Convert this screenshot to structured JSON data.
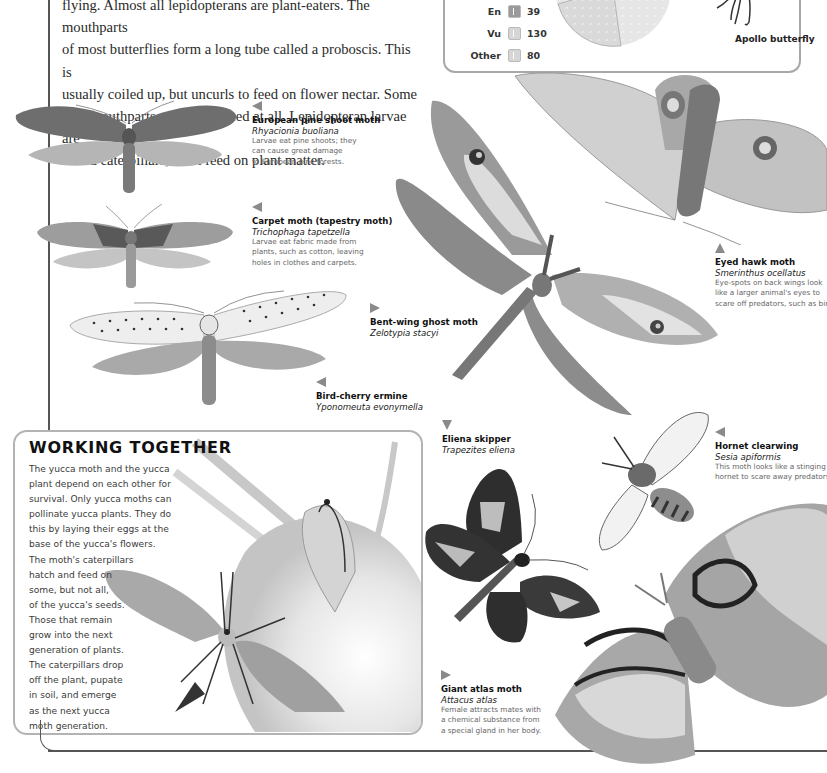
{
  "intro": {
    "lines": [
      "flying. Almost all lepidopterans are plant-eaters. The mouthparts",
      "of most butterflies form a long tube called a proboscis. This is",
      "usually coiled up, but uncurls to feed on flower nectar. Some",
      "lack mouthparts and do not feed at all. Lepidopteran larvae are",
      "called caterpillars; most feed on plant matter."
    ]
  },
  "stats_box": {
    "legend": [
      {
        "label": "En",
        "icon": "butterfly-silhouette-icon",
        "value": "39"
      },
      {
        "label": "Vu",
        "icon": "butterfly-silhouette-icon",
        "value": "130"
      },
      {
        "label": "Other",
        "icon": "butterfly-silhouette-icon",
        "value": "80"
      }
    ],
    "image_caption": "Apollo butterfly"
  },
  "captions": {
    "pine_shoot": {
      "arrow": "left",
      "name": "European pine shoot moth",
      "latin": "Rhyacionia buoliana",
      "desc": [
        "Larvae eat pine shoots; they",
        "can cause great damage",
        "to European pine forests."
      ]
    },
    "carpet": {
      "arrow": "left",
      "name": "Carpet moth (tapestry moth)",
      "latin": "Trichophaga tapetzella",
      "desc": [
        "Larvae eat fabric made from",
        "plants, such as cotton, leaving",
        "holes in clothes and carpets."
      ]
    },
    "bent_wing": {
      "arrow": "right",
      "name": "Bent-wing ghost moth",
      "latin": "Zelotypia stacyi"
    },
    "bird_cherry": {
      "arrow": "left",
      "name": "Bird-cherry ermine",
      "latin": "Yponomeuta evonymella"
    },
    "eyed_hawk": {
      "arrow": "up",
      "name": "Eyed hawk moth",
      "latin": "Smerinthus ocellatus",
      "desc": [
        "Eye-spots on back wings look",
        "like a larger animal's eyes to",
        "scare off predators, such as birds."
      ]
    },
    "hornet": {
      "arrow": "left",
      "name": "Hornet clearwing",
      "latin": "Sesia apiformis",
      "desc": [
        "This moth looks like a stinging",
        "hornet to scare away predators."
      ]
    },
    "eliena": {
      "arrow": "down",
      "name": "Eliena skipper",
      "latin": "Trapezites eliena"
    },
    "atlas": {
      "arrow": "right",
      "name": "Giant atlas moth",
      "latin": "Attacus atlas",
      "desc": [
        "Female attracts mates with",
        "a chemical substance from",
        "a special gland in her body."
      ]
    }
  },
  "working_together": {
    "title": "WORKING TOGETHER",
    "lines": [
      "The yucca moth and the yucca",
      "plant depend on each other for",
      "survival. Only yucca moths can",
      "pollinate yucca plants. They do",
      "this by laying their eggs at the",
      "base of the yucca's flowers.",
      "The moth's caterpillars",
      "hatch and feed on",
      "some, but not all,",
      "of the yucca's seeds.",
      "Those that remain",
      "grow into the next",
      "generation of plants.",
      "The caterpillars drop",
      "off the plant, pupate",
      "in soil, and emerge",
      "as the next yucca",
      "moth generation."
    ]
  },
  "colors": {
    "text": "#1a1a1a",
    "caption_desc": "#666666",
    "box_border": "#b3b3b3",
    "rule": "#555555",
    "arrow": "#8a8a8a"
  }
}
